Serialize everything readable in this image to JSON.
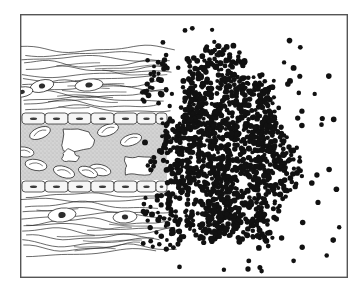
{
  "figure": {
    "caption": "",
    "width": 362,
    "height": 292,
    "background_color": "#ffffff",
    "ink_color": "#1a1a1a",
    "stipple_color": "#c9c9c9",
    "frame": {
      "name": "illustration-border",
      "x": 20,
      "y": 14,
      "width": 327,
      "height": 263,
      "stroke": "#555555",
      "stroke_width": 1.4,
      "fill": "#ffffff"
    }
  },
  "regions": [
    {
      "id": "upper-connective-tissue",
      "label": "Upper connective tissue with collagen fibers",
      "y_top": 46,
      "y_bottom": 112,
      "fiber_count": 13,
      "fill": "#ffffff"
    },
    {
      "id": "upper-endothelium",
      "label": "Upper endothelial cell layer",
      "y_top": 112,
      "y_bottom": 124,
      "cell_count": 7,
      "fill": "#f4f4f4"
    },
    {
      "id": "vessel-lumen",
      "label": "Vessel lumen with plasma stipple",
      "x_left": 21,
      "x_right": 167,
      "y_top": 124,
      "y_bottom": 180,
      "fill": "#cfcfcf"
    },
    {
      "id": "lower-endothelium",
      "label": "Lower endothelial cell layer",
      "y_top": 180,
      "y_bottom": 192,
      "cell_count": 7,
      "fill": "#f4f4f4"
    },
    {
      "id": "lower-connective-tissue",
      "label": "Lower connective tissue with collagen fibers",
      "y_top": 192,
      "y_bottom": 256,
      "fiber_count": 12,
      "fill": "#ffffff"
    }
  ],
  "endothelial_cells": {
    "label": "Endothelial cell",
    "upper_row_y": 113,
    "lower_row_y": 181,
    "cell_height": 11,
    "x_positions": [
      22,
      45,
      68,
      91,
      114,
      137,
      156
    ],
    "cell_widths": [
      23,
      23,
      23,
      23,
      23,
      19,
      11
    ],
    "nucleus_color": "#3a3a3a"
  },
  "red_blood_cells": {
    "label": "Red blood cell",
    "count": 8,
    "stroke": "#2b2b2b",
    "fill": "#ffffff",
    "items": [
      {
        "cx": 40,
        "cy": 133,
        "rx": 11,
        "ry": 5.5,
        "rot": -22
      },
      {
        "cx": 108,
        "cy": 130,
        "rx": 11,
        "ry": 5.5,
        "rot": -20
      },
      {
        "cx": 131,
        "cy": 140,
        "rx": 11,
        "ry": 5.5,
        "rot": -18
      },
      {
        "cx": 24,
        "cy": 152,
        "rx": 10,
        "ry": 5.0,
        "rot": 8
      },
      {
        "cx": 36,
        "cy": 165,
        "rx": 11,
        "ry": 5.5,
        "rot": 10
      },
      {
        "cx": 64,
        "cy": 172,
        "rx": 11,
        "ry": 5.5,
        "rot": 18
      },
      {
        "cx": 100,
        "cy": 170,
        "rx": 11,
        "ry": 5.5,
        "rot": 12
      },
      {
        "cx": 88,
        "cy": 172,
        "rx": 10,
        "ry": 5.0,
        "rot": 20
      }
    ]
  },
  "white_blood_cells": {
    "label": "White blood cell (leukocyte)",
    "count": 3,
    "stroke": "#2b2b2b",
    "fill": "#ffffff"
  },
  "fibroblasts": {
    "label": "Fibroblast nucleus in connective tissue",
    "count": 5,
    "items": [
      {
        "cx": 42,
        "cy": 86,
        "rx": 12,
        "ry": 6,
        "rot": -14
      },
      {
        "cx": 89,
        "cy": 85,
        "rx": 14,
        "ry": 6,
        "rot": -6
      },
      {
        "cx": 22,
        "cy": 92,
        "rx": 11,
        "ry": 5,
        "rot": -10
      },
      {
        "cx": 62,
        "cy": 215,
        "rx": 14,
        "ry": 7,
        "rot": -6
      },
      {
        "cx": 125,
        "cy": 217,
        "rx": 12,
        "ry": 6,
        "rot": -4
      }
    ]
  },
  "bacteria_mass": {
    "label": "Dense bacterial colony",
    "description": "Large dense cloud of uniform round bacteria forming an abscess",
    "dot_radius_min": 1.9,
    "dot_radius_max": 3.0,
    "color": "#111111",
    "dense_core": {
      "center_x": 226,
      "center_y": 152,
      "radius_x": 67,
      "radius_y": 104,
      "dot_count": 1450
    },
    "infiltration": {
      "label": "Bacteria infiltrating along collagen fibers",
      "x_min": 142,
      "x_max": 172,
      "dot_count": 70
    },
    "scatter": {
      "label": "Scattered isolated bacteria",
      "x_min": 150,
      "x_max": 342,
      "y_min": 22,
      "y_max": 272,
      "dot_count": 52
    }
  },
  "legend": {
    "visible": false,
    "entries": []
  }
}
